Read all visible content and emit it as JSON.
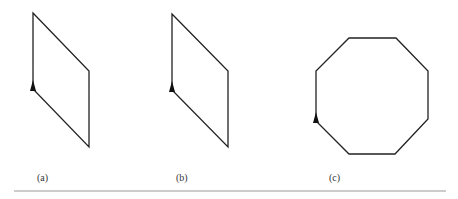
{
  "figures": [
    {
      "id": "a",
      "label": "(a)",
      "shape": "parallelogram",
      "points": [
        [
          33,
          13
        ],
        [
          89,
          71
        ],
        [
          89,
          147
        ],
        [
          33,
          89
        ]
      ],
      "arrow": [
        33,
        89
      ]
    },
    {
      "id": "b",
      "label": "(b)",
      "shape": "parallelogram",
      "points": [
        [
          172,
          14
        ],
        [
          228,
          71
        ],
        [
          228,
          147
        ],
        [
          172,
          90
        ]
      ],
      "arrow": [
        172,
        90
      ]
    },
    {
      "id": "c",
      "label": "(c)",
      "shape": "octagon",
      "points": [
        [
          349,
          38
        ],
        [
          396,
          38
        ],
        [
          428,
          71
        ],
        [
          428,
          119
        ],
        [
          395,
          154
        ],
        [
          349,
          154
        ],
        [
          316,
          121
        ],
        [
          316,
          71
        ]
      ],
      "arrow": [
        316,
        121
      ]
    }
  ],
  "colors": {
    "stroke": "#222222",
    "rule": "#999999"
  }
}
